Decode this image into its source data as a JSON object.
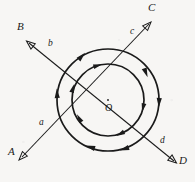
{
  "figure": {
    "background_color": "#f7f6f4",
    "ink_color": "#1a1a1a"
  },
  "center": {
    "label": "O",
    "x": 108,
    "y": 101
  },
  "circles": [
    {
      "name": "outer-loop",
      "cx": 108,
      "cy": 100,
      "r": 51,
      "stroke_width": 1.6,
      "direction": "counterclockwise",
      "arrow_count": 6
    },
    {
      "name": "inner-loop",
      "cx": 108,
      "cy": 100,
      "r": 36,
      "stroke_width": 1.6,
      "direction": "counterclockwise",
      "arrow_count": 5
    }
  ],
  "lines": [
    {
      "name": "line-AC",
      "from_label": "A",
      "to_label": "C",
      "from_point": {
        "x": 19,
        "y": 160
      },
      "to_point": {
        "x": 150,
        "y": 22
      },
      "segment_labels": [
        {
          "text": "a",
          "x": 44,
          "y": 129
        },
        {
          "text": "c",
          "x": 132,
          "y": 37
        }
      ],
      "arrow_at": "both"
    },
    {
      "name": "line-BD",
      "from_label": "B",
      "to_label": "D",
      "from_point": {
        "x": 27,
        "y": 41
      },
      "to_point": {
        "x": 176,
        "y": 163
      },
      "segment_labels": [
        {
          "text": "b",
          "x": 53,
          "y": 50
        },
        {
          "text": "d",
          "x": 163,
          "y": 147
        }
      ],
      "arrow_at": "both"
    }
  ],
  "endpoint_labels": [
    {
      "name": "endpoint-label-A",
      "text": "A",
      "x": 8,
      "y": 152
    },
    {
      "name": "endpoint-label-B",
      "text": "B",
      "x": 18,
      "y": 27
    },
    {
      "name": "endpoint-label-C",
      "text": "C",
      "x": 148,
      "y": 5
    },
    {
      "name": "endpoint-label-D",
      "text": "D",
      "x": 180,
      "y": 160
    }
  ],
  "segment_labels": [
    {
      "name": "segment-label-a",
      "text": "a",
      "x": 40,
      "y": 123
    },
    {
      "name": "segment-label-b",
      "text": "b",
      "x": 49,
      "y": 44
    },
    {
      "name": "segment-label-c",
      "text": "c",
      "x": 130,
      "y": 31
    },
    {
      "name": "segment-label-d",
      "text": "d",
      "x": 160,
      "y": 141
    }
  ]
}
